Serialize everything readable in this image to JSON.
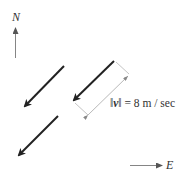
{
  "labels": {
    "north": "N",
    "east": "E",
    "magnitude_prefix": "‖",
    "vector": "v",
    "magnitude_suffix": "‖ = 8 m / sec"
  },
  "colors": {
    "arrow": "#222222",
    "dimension": "#999999",
    "compass": "#666666"
  }
}
